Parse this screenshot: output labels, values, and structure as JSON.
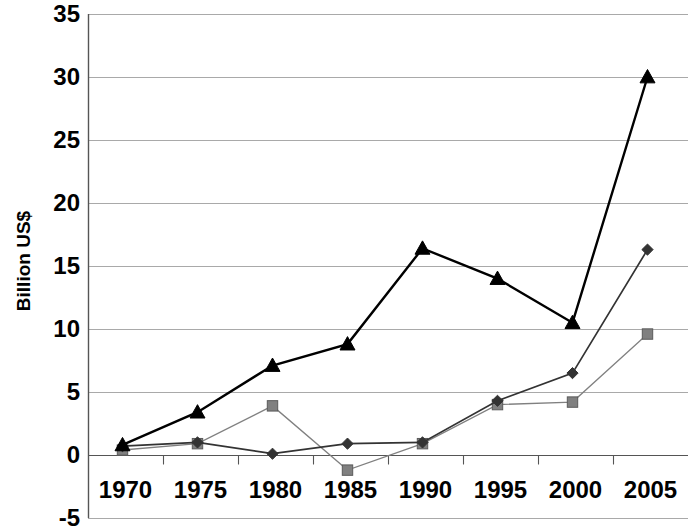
{
  "chart_data": {
    "type": "line",
    "title": "",
    "subtitle": "",
    "xlabel": "",
    "ylabel": "Billion US$",
    "categories": [
      "1970",
      "1975",
      "1980",
      "1985",
      "1990",
      "1995",
      "2000",
      "2005"
    ],
    "ylim": [
      -5,
      35
    ],
    "yticks": [
      -5,
      0,
      5,
      10,
      15,
      20,
      25,
      30,
      35
    ],
    "ytick_labels": [
      "-5",
      "0",
      "5",
      "10",
      "15",
      "20",
      "25",
      "30",
      "35"
    ],
    "grid": true,
    "grid_axis": "y",
    "legend": "none",
    "annotations": [],
    "series": [
      {
        "name": "series-1-triangle",
        "marker": "triangle",
        "color": "#000000",
        "line_width": 2.4,
        "values": [
          0.8,
          3.4,
          7.1,
          8.8,
          16.4,
          14.0,
          10.5,
          30.0
        ]
      },
      {
        "name": "series-2-diamond",
        "marker": "diamond",
        "color": "#333333",
        "line_width": 1.7,
        "values": [
          0.7,
          1.0,
          0.1,
          0.9,
          1.0,
          4.3,
          6.5,
          16.3
        ]
      },
      {
        "name": "series-3-square",
        "marker": "square",
        "color": "#808080",
        "line_width": 1.3,
        "values": [
          0.4,
          0.9,
          3.9,
          -1.2,
          0.9,
          4.0,
          4.2,
          9.6
        ]
      }
    ]
  },
  "axis": {
    "y_title": "Billion US$",
    "x_labels": [
      "1970",
      "1975",
      "1980",
      "1985",
      "1990",
      "1995",
      "2000",
      "2005"
    ],
    "y_labels": [
      "35",
      "30",
      "25",
      "20",
      "15",
      "10",
      "5",
      "0",
      "-5"
    ]
  },
  "colors": {
    "series_1": "#000000",
    "series_2": "#333333",
    "series_3": "#808080",
    "grid": "#a9a9a9",
    "axis": "#555555",
    "background": "#ffffff"
  }
}
